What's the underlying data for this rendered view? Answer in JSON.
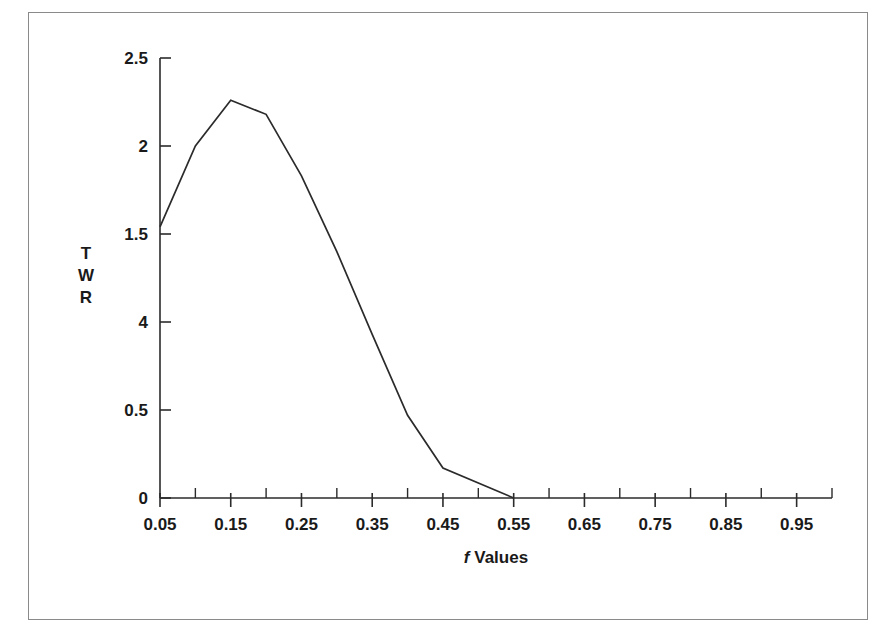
{
  "figure": {
    "frame_color": "#8a8a8a",
    "background": "#ffffff",
    "line_color": "#2b2b2b"
  },
  "axes": {
    "y_title_lines": [
      "T",
      "W",
      "R"
    ],
    "x_title_italic": "f",
    "x_title_rest": " Values",
    "x_tick_labels": [
      "0.05",
      "0.15",
      "0.25",
      "0.35",
      "0.45",
      "0.55",
      "0.65",
      "0.75",
      "0.85",
      "0.95"
    ],
    "y_tick_labels": [
      "2.5",
      "2",
      "1.5",
      "4",
      "0.5",
      "0"
    ]
  },
  "chart_data": {
    "type": "line",
    "title": "",
    "xlabel": "f Values",
    "ylabel": "TWR",
    "xlim": [
      0.05,
      1.0
    ],
    "ylim": [
      0,
      2.5
    ],
    "grid": false,
    "legend": "none",
    "x_ticks": [
      0.05,
      0.15,
      0.25,
      0.35,
      0.45,
      0.55,
      0.65,
      0.75,
      0.85,
      0.95
    ],
    "x_minor_ticks": [
      0.1,
      0.2,
      0.3,
      0.4,
      0.5,
      0.6,
      0.7,
      0.8,
      0.9,
      1.0
    ],
    "y_ticks": [
      0,
      0.5,
      1,
      1.5,
      2,
      2.5
    ],
    "y_tick_display_labels": [
      "0",
      "0.5",
      "4",
      "1.5",
      "2",
      "2.5"
    ],
    "series": [
      {
        "name": "TWR",
        "x": [
          0.05,
          0.1,
          0.15,
          0.2,
          0.25,
          0.3,
          0.35,
          0.4,
          0.45,
          0.55
        ],
        "values": [
          1.54,
          2.0,
          2.26,
          2.18,
          1.83,
          1.4,
          0.93,
          0.47,
          0.17,
          0.0
        ]
      }
    ],
    "annotations": {
      "peak_x": 0.15,
      "peak_y": 2.26,
      "zero_crossing_x": 0.55
    }
  }
}
